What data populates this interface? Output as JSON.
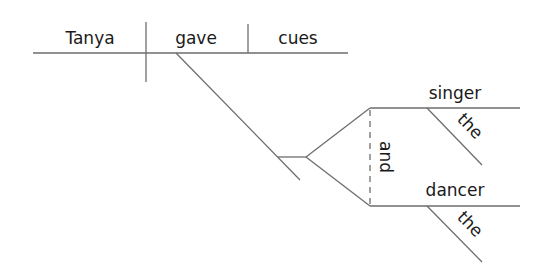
{
  "diagram": {
    "type": "sentence-diagram",
    "subject": "Tanya",
    "verb": "gave",
    "direct_object": "cues",
    "indirect_object": {
      "conjunction": "and",
      "items": [
        {
          "noun": "singer",
          "modifier": "the"
        },
        {
          "noun": "dancer",
          "modifier": "the"
        }
      ]
    }
  }
}
